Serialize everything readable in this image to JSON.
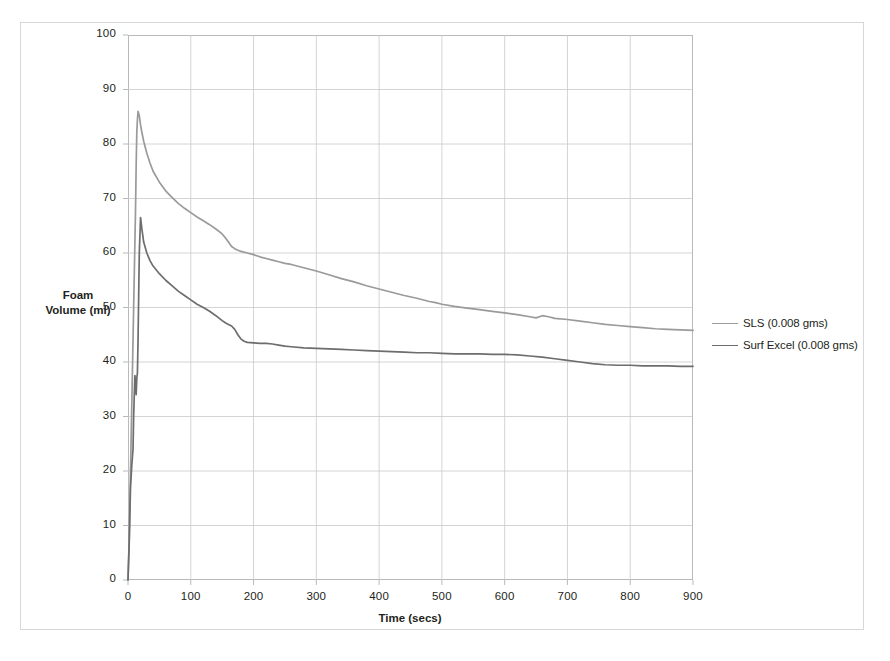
{
  "chart_data": {
    "type": "line",
    "title": "",
    "xlabel": "Time (secs)",
    "ylabel": "Foam Volume (ml)",
    "ylabel_lines": [
      "Foam",
      "Volume (ml)"
    ],
    "xlim": [
      0,
      900
    ],
    "ylim": [
      0,
      100
    ],
    "xticks": [
      0,
      100,
      200,
      300,
      400,
      500,
      600,
      700,
      800,
      900
    ],
    "yticks": [
      0,
      10,
      20,
      30,
      40,
      50,
      60,
      70,
      80,
      90,
      100
    ],
    "grid": true,
    "legend_position": "right",
    "series": [
      {
        "name": "SLS (0.008 gms)",
        "color": "#9a9a9a",
        "x": [
          0,
          2,
          4,
          6,
          8,
          10,
          12,
          13,
          14,
          15,
          16,
          18,
          20,
          22,
          25,
          30,
          35,
          40,
          50,
          60,
          70,
          80,
          90,
          100,
          110,
          120,
          130,
          140,
          150,
          155,
          160,
          165,
          170,
          175,
          180,
          190,
          200,
          210,
          220,
          230,
          240,
          250,
          260,
          280,
          300,
          320,
          340,
          360,
          380,
          400,
          420,
          440,
          460,
          480,
          490,
          500,
          520,
          540,
          560,
          580,
          600,
          620,
          640,
          650,
          660,
          670,
          680,
          700,
          720,
          740,
          760,
          780,
          800,
          820,
          840,
          860,
          880,
          900
        ],
        "y": [
          0,
          8,
          20,
          32,
          44,
          56,
          68,
          76,
          82,
          84.5,
          86,
          85.2,
          83.5,
          82.2,
          80.5,
          78.3,
          76.5,
          75.0,
          73.0,
          71.4,
          70.2,
          69.1,
          68.2,
          67.4,
          66.6,
          65.9,
          65.2,
          64.4,
          63.5,
          62.8,
          62.0,
          61.2,
          60.8,
          60.5,
          60.3,
          60.0,
          59.7,
          59.3,
          59.0,
          58.7,
          58.4,
          58.1,
          57.9,
          57.3,
          56.7,
          56.0,
          55.3,
          54.7,
          54.0,
          53.4,
          52.8,
          52.2,
          51.7,
          51.1,
          50.9,
          50.6,
          50.2,
          49.9,
          49.6,
          49.3,
          49.0,
          48.7,
          48.3,
          48.1,
          48.5,
          48.3,
          48.0,
          47.8,
          47.5,
          47.2,
          46.9,
          46.7,
          46.5,
          46.3,
          46.1,
          46.0,
          45.9,
          45.8
        ]
      },
      {
        "name": "Surf Excel (0.008 gms)",
        "color": "#6d6d6d",
        "x": [
          0,
          2,
          4,
          6,
          8,
          9,
          10,
          11,
          12,
          13,
          14,
          15,
          16,
          17,
          18,
          20,
          22,
          25,
          30,
          35,
          40,
          50,
          60,
          70,
          80,
          90,
          100,
          110,
          120,
          130,
          140,
          150,
          155,
          160,
          165,
          170,
          175,
          180,
          185,
          190,
          200,
          210,
          220,
          230,
          240,
          250,
          260,
          280,
          300,
          320,
          340,
          360,
          380,
          400,
          420,
          440,
          460,
          480,
          500,
          520,
          540,
          560,
          580,
          600,
          620,
          640,
          660,
          680,
          700,
          720,
          740,
          760,
          780,
          800,
          820,
          840,
          860,
          880,
          900
        ],
        "y": [
          0,
          7,
          17,
          21,
          24,
          30,
          34,
          37.5,
          36,
          34,
          37,
          38,
          44,
          52,
          60,
          66.5,
          64.5,
          62.0,
          60.0,
          58.6,
          57.6,
          56.2,
          55.0,
          54.0,
          53.0,
          52.2,
          51.4,
          50.6,
          50.0,
          49.3,
          48.5,
          47.6,
          47.2,
          46.9,
          46.6,
          46.0,
          45.0,
          44.2,
          43.8,
          43.6,
          43.5,
          43.4,
          43.4,
          43.3,
          43.1,
          42.9,
          42.8,
          42.6,
          42.5,
          42.4,
          42.3,
          42.2,
          42.1,
          42.0,
          41.9,
          41.8,
          41.7,
          41.7,
          41.6,
          41.5,
          41.5,
          41.5,
          41.4,
          41.4,
          41.3,
          41.1,
          40.9,
          40.6,
          40.3,
          40.0,
          39.7,
          39.5,
          39.4,
          39.4,
          39.3,
          39.3,
          39.3,
          39.2,
          39.2
        ]
      }
    ]
  },
  "legend": {
    "items": [
      {
        "label": "SLS (0.008 gms)",
        "color": "#9a9a9a"
      },
      {
        "label": "Surf Excel (0.008 gms)",
        "color": "#6d6d6d"
      }
    ]
  },
  "axes": {
    "x_title": "Time (secs)",
    "y_title_line1": "Foam",
    "y_title_line2": "Volume (ml)"
  },
  "colors": {
    "series_sls": "#9a9a9a",
    "series_surfexcel": "#6d6d6d",
    "grid": "#c9c9c9",
    "frame": "#b9b9b9",
    "text": "#231f20"
  }
}
